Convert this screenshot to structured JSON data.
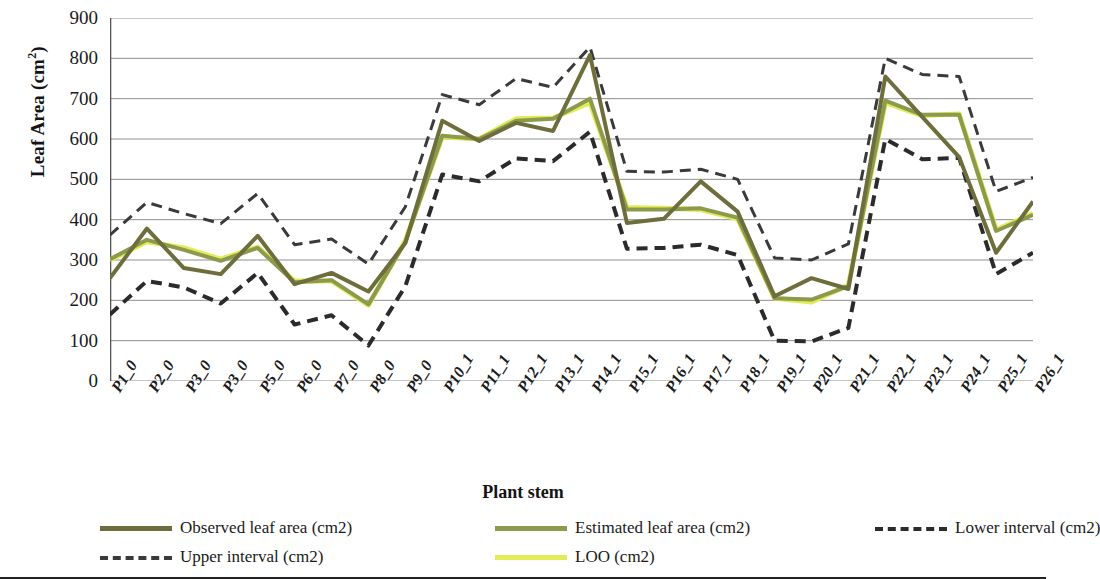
{
  "axes": {
    "y_title_main": "Leaf Area (cm",
    "y_title_sup": "2",
    "y_title_close": ")",
    "x_title": "Plant stem"
  },
  "legend": {
    "items": [
      {
        "label": "Observed leaf area (cm2)",
        "color": "#6e6e3c",
        "style": "solid"
      },
      {
        "label": "Estimated leaf area (cm2)",
        "color": "#8c9a4e",
        "style": "solid"
      },
      {
        "label": "Lower interval (cm2)",
        "color": "#2b2b2b",
        "style": "dashed"
      },
      {
        "label": "Upper interval (cm2)",
        "color": "#3a3a3a",
        "style": "dashed"
      },
      {
        "label": "LOO (cm2)",
        "color": "#e2ec55",
        "style": "solid"
      }
    ]
  },
  "chart_data": {
    "type": "line",
    "title": "",
    "xlabel": "Plant stem",
    "ylabel": "Leaf Area (cm2)",
    "ylim": [
      0,
      900
    ],
    "ytick_values": [
      0,
      100,
      200,
      300,
      400,
      500,
      600,
      700,
      800,
      900
    ],
    "grid": true,
    "legend_position": "bottom",
    "categories": [
      "P1_0",
      "P2_0",
      "P3_0",
      "P3_0",
      "P5_0",
      "P6_0",
      "P7_0",
      "P8_0",
      "P9_0",
      "P10_1",
      "P11_1",
      "P12_1",
      "P13_1",
      "P14_1",
      "P15_1",
      "P16_1",
      "P17_1",
      "P18_1",
      "P19_1",
      "P20_1",
      "P21_1",
      "P22_1",
      "P23_1",
      "P24_1",
      "P25_1",
      "P26_1"
    ],
    "series": [
      {
        "name": "Observed leaf area (cm2)",
        "color": "#6e6e3c",
        "style": "solid",
        "width": 4,
        "values": [
          255,
          378,
          280,
          265,
          360,
          240,
          268,
          222,
          342,
          645,
          595,
          640,
          620,
          808,
          392,
          402,
          495,
          420,
          210,
          255,
          228,
          755,
          655,
          555,
          318,
          445
        ]
      },
      {
        "name": "Estimated leaf area (cm2)",
        "color": "#8c9a4e",
        "style": "solid",
        "width": 4,
        "values": [
          302,
          350,
          325,
          298,
          330,
          245,
          250,
          190,
          345,
          608,
          600,
          645,
          650,
          700,
          425,
          425,
          428,
          405,
          205,
          202,
          235,
          695,
          660,
          660,
          372,
          412
        ]
      },
      {
        "name": "LOO (cm2)",
        "color": "#e2ec55",
        "style": "solid",
        "width": 5,
        "values": [
          300,
          345,
          330,
          302,
          332,
          248,
          248,
          188,
          348,
          605,
          600,
          650,
          652,
          690,
          430,
          428,
          425,
          402,
          205,
          196,
          238,
          690,
          658,
          662,
          375,
          415
        ]
      },
      {
        "name": "Upper interval (cm2)",
        "color": "#3a3a3a",
        "style": "dashed",
        "width": 3,
        "values": [
          362,
          443,
          415,
          390,
          465,
          338,
          352,
          290,
          432,
          710,
          685,
          750,
          728,
          828,
          520,
          518,
          525,
          500,
          305,
          300,
          340,
          800,
          760,
          755,
          470,
          505
        ]
      },
      {
        "name": "Lower interval (cm2)",
        "color": "#2b2b2b",
        "style": "dashed",
        "width": 4,
        "values": [
          165,
          248,
          232,
          192,
          268,
          140,
          163,
          88,
          235,
          512,
          495,
          552,
          545,
          618,
          328,
          330,
          338,
          312,
          100,
          98,
          132,
          600,
          550,
          553,
          265,
          318
        ]
      }
    ]
  }
}
